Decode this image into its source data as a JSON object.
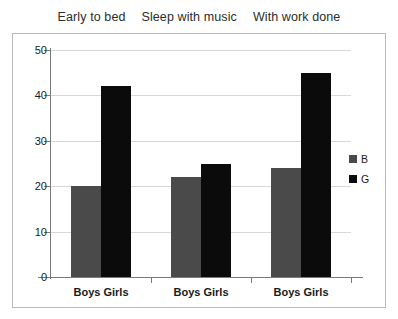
{
  "titles": [
    {
      "label": "Early to bed"
    },
    {
      "label": "Sleep with music"
    },
    {
      "label": "With work done"
    }
  ],
  "legend": {
    "items": [
      {
        "key": "B",
        "label": "B",
        "color": "#4a4a4a"
      },
      {
        "key": "G",
        "label": "G",
        "color": "#0b0b0b"
      }
    ]
  },
  "axis": {
    "y_ticks": [
      "0",
      "10",
      "20",
      "30",
      "40",
      "50"
    ],
    "x_group_labels": [
      "Boys Girls",
      "Boys Girls",
      "Boys Girls"
    ]
  },
  "chart_data": {
    "type": "bar",
    "title": "Early to bed   Sleep with music   With work done",
    "xlabel": "",
    "ylabel": "",
    "ylim": [
      0,
      50
    ],
    "yticks": [
      0,
      10,
      20,
      30,
      40,
      50
    ],
    "grid": true,
    "legend_position": "right",
    "categories": [
      "Early to bed",
      "Sleep with music",
      "With work done"
    ],
    "category_tick_labels": [
      "Boys Girls",
      "Boys Girls",
      "Boys Girls"
    ],
    "series": [
      {
        "name": "B",
        "label": "Boys",
        "color": "#4a4a4a",
        "values": [
          20,
          22,
          24
        ]
      },
      {
        "name": "G",
        "label": "Girls",
        "color": "#0b0b0b",
        "values": [
          42,
          25,
          45
        ]
      }
    ]
  }
}
